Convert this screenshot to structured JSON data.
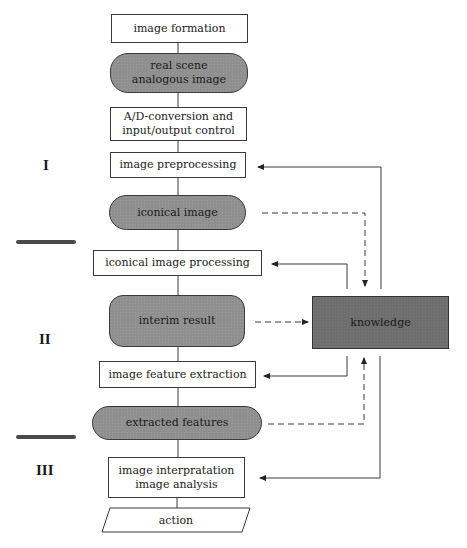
{
  "diagram": {
    "nodes": [
      {
        "id": "image-formation",
        "label": "image formation",
        "shape": "rect"
      },
      {
        "id": "real-scene",
        "label": "real scene\nanalogous image",
        "shape": "pill"
      },
      {
        "id": "ad-conversion",
        "label": "A/D-conversion and\ninput/output control",
        "shape": "rect"
      },
      {
        "id": "preprocessing",
        "label": "image preprocessing",
        "shape": "rect"
      },
      {
        "id": "iconical-image",
        "label": "iconical image",
        "shape": "pill"
      },
      {
        "id": "iconical-processing",
        "label": "iconical image processing",
        "shape": "rect"
      },
      {
        "id": "interim-result",
        "label": "interim result",
        "shape": "pill"
      },
      {
        "id": "feature-extraction",
        "label": "image feature extraction",
        "shape": "rect"
      },
      {
        "id": "extracted-features",
        "label": "extracted features",
        "shape": "pill"
      },
      {
        "id": "interpretation",
        "label": "image interpratation\nimage analysis",
        "shape": "rect"
      },
      {
        "id": "action",
        "label": "action",
        "shape": "parallelogram"
      },
      {
        "id": "knowledge",
        "label": "knowledge",
        "shape": "rect-dark"
      }
    ],
    "stages": [
      "I",
      "II",
      "III"
    ],
    "edges": [
      {
        "from": "knowledge",
        "to": "preprocessing",
        "style": "solid"
      },
      {
        "from": "iconical-image",
        "to": "knowledge",
        "style": "dashed"
      },
      {
        "from": "knowledge",
        "to": "iconical-processing",
        "style": "solid"
      },
      {
        "from": "interim-result",
        "to": "knowledge",
        "style": "dashed"
      },
      {
        "from": "knowledge",
        "to": "feature-extraction",
        "style": "solid"
      },
      {
        "from": "extracted-features",
        "to": "knowledge",
        "style": "dashed"
      },
      {
        "from": "knowledge",
        "to": "interpretation",
        "style": "solid"
      }
    ],
    "colors": {
      "pill_fill": "#8f8f8f",
      "knowledge_fill": "#6e6e6e",
      "line": "#3a3a3a"
    }
  }
}
